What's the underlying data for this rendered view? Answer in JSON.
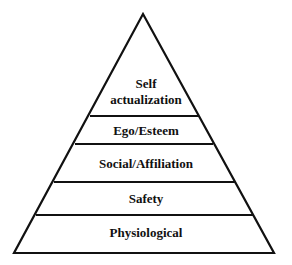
{
  "diagram": {
    "type": "pyramid",
    "levels": [
      {
        "id": "self-actualization",
        "line1": "Self",
        "line2": "actualization"
      },
      {
        "id": "ego-esteem",
        "label": "Ego/Esteem"
      },
      {
        "id": "social-affiliation",
        "label": "Social/Affiliation"
      },
      {
        "id": "safety",
        "label": "Safety"
      },
      {
        "id": "physiological",
        "label": "Physiological"
      }
    ],
    "colors": {
      "line": "#111111",
      "fill": "#ffffff",
      "text": "#111111"
    }
  }
}
